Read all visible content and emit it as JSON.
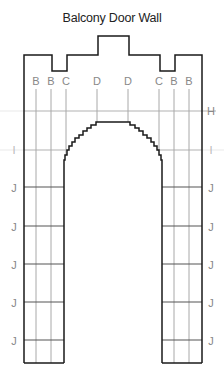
{
  "title": "Balcony Door Wall",
  "column_labels": [
    {
      "label": "B",
      "x": 36
    },
    {
      "label": "B",
      "x": 51
    },
    {
      "label": "C",
      "x": 66
    },
    {
      "label": "D",
      "x": 97
    },
    {
      "label": "D",
      "x": 128
    },
    {
      "label": "C",
      "x": 159
    },
    {
      "label": "B",
      "x": 174
    },
    {
      "label": "B",
      "x": 189
    }
  ],
  "row_labels": {
    "H": {
      "label": "H",
      "y": 111
    },
    "I": {
      "label": "I",
      "y": 150
    },
    "J": [
      {
        "label": "J",
        "y": 187
      },
      {
        "label": "J",
        "y": 226
      },
      {
        "label": "J",
        "y": 264
      },
      {
        "label": "J",
        "y": 302
      },
      {
        "label": "J",
        "y": 340
      }
    ]
  },
  "colors": {
    "outline": "#1a1a1a",
    "grid": "#a8a8a8",
    "label": "#888888"
  }
}
